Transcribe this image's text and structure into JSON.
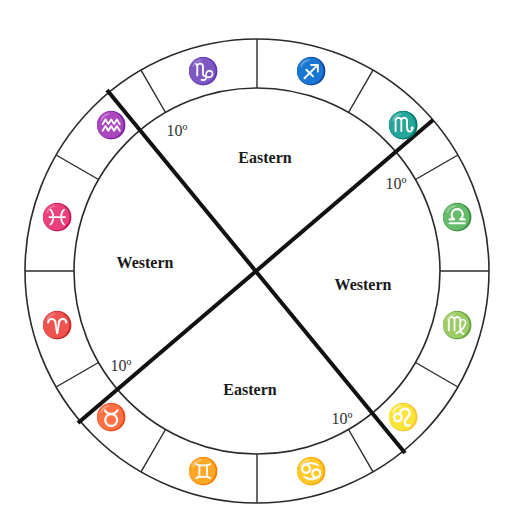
{
  "diagram": {
    "center": {
      "x": 257,
      "y": 271
    },
    "outer_radius": 232,
    "inner_radius": 183,
    "colors": {
      "line": "#2a2a2a",
      "axis": "#111111",
      "text": "#1a1a1a",
      "background": "#ffffff"
    },
    "zodiac_signs": [
      {
        "name": "Sagittarius",
        "glyph": "♐"
      },
      {
        "name": "Scorpio",
        "glyph": "♏"
      },
      {
        "name": "Libra",
        "glyph": "♎"
      },
      {
        "name": "Virgo",
        "glyph": "♍"
      },
      {
        "name": "Leo",
        "glyph": "♌"
      },
      {
        "name": "Cancer",
        "glyph": "♋"
      },
      {
        "name": "Gemini",
        "glyph": "♊"
      },
      {
        "name": "Taurus",
        "glyph": "♉"
      },
      {
        "name": "Aries",
        "glyph": "♈"
      },
      {
        "name": "Pisces",
        "glyph": "♓"
      },
      {
        "name": "Aquarius",
        "glyph": "♒"
      },
      {
        "name": "Capricorn",
        "glyph": "♑"
      }
    ],
    "regions": {
      "top": "Eastern",
      "bottom": "Eastern",
      "left": "Western",
      "right": "Western"
    },
    "degree_labels": {
      "upper_left": "10º",
      "upper_right": "10º",
      "lower_left": "10º",
      "lower_right": "10º"
    }
  }
}
